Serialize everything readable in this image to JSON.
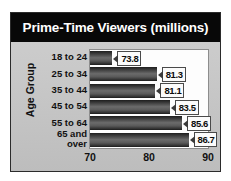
{
  "chart_data": {
    "type": "bar",
    "orientation": "horizontal",
    "title": "Prime-Time Viewers (millions)",
    "xlabel": "",
    "ylabel": "Age Group",
    "categories": [
      "18 to 24",
      "25 to 34",
      "35 to 44",
      "45 to 54",
      "55 to 64",
      "65 and\nover"
    ],
    "values": [
      73.8,
      81.3,
      81.1,
      83.5,
      85.6,
      86.7
    ],
    "value_labels": [
      "73.8",
      "81.3",
      "81.1",
      "83.5",
      "85.6",
      "86.7"
    ],
    "xlim": [
      70,
      90
    ],
    "xticks": [
      70,
      80,
      90
    ],
    "xtick_labels": [
      "70",
      "80",
      "90"
    ],
    "grid": false,
    "legend": null,
    "colors": {
      "title_background": "#080808",
      "title_text": "#ffffff",
      "panel_background": "#c6c6c6",
      "plot_background": "#fdfdfd",
      "bar_dark": "#1d1d1d",
      "bar_light": "#6b6b6b",
      "callout_background": "#fbfbfb",
      "frame_border": "#2b2b2b"
    }
  },
  "chart": {
    "title": "Prime-Time Viewers (millions)",
    "y_axis_title": "Age Group",
    "rows": [
      {
        "category": "18 to 24",
        "category_line2": "",
        "value_label": "73.8"
      },
      {
        "category": "25 to 34",
        "category_line2": "",
        "value_label": "81.3"
      },
      {
        "category": "35 to 44",
        "category_line2": "",
        "value_label": "81.1"
      },
      {
        "category": "45 to 54",
        "category_line2": "",
        "value_label": "83.5"
      },
      {
        "category": "55 to 64",
        "category_line2": "",
        "value_label": "85.6"
      },
      {
        "category": "65 and",
        "category_line2": "over",
        "value_label": "86.7"
      }
    ],
    "x_ticks": [
      {
        "label": "70"
      },
      {
        "label": "80"
      },
      {
        "label": "90"
      }
    ]
  }
}
